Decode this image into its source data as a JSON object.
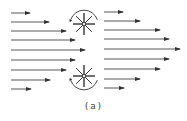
{
  "caption": "(a)",
  "colors": {
    "stroke": "#333333",
    "background": "#ffffff"
  },
  "diagram": {
    "left_arrows": [
      {
        "y": 13,
        "x1": 11,
        "x2": 30
      },
      {
        "y": 22,
        "x1": 11,
        "x2": 49
      },
      {
        "y": 31,
        "x1": 11,
        "x2": 66
      },
      {
        "y": 40,
        "x1": 11,
        "x2": 75
      },
      {
        "y": 50,
        "x1": 11,
        "x2": 85
      },
      {
        "y": 60,
        "x1": 11,
        "x2": 75
      },
      {
        "y": 70,
        "x1": 11,
        "x2": 66
      },
      {
        "y": 80,
        "x1": 11,
        "x2": 50
      },
      {
        "y": 89,
        "x1": 11,
        "x2": 31
      }
    ],
    "right_arrows": [
      {
        "y": 12,
        "x1": 104,
        "x2": 123
      },
      {
        "y": 21,
        "x1": 104,
        "x2": 140
      },
      {
        "y": 30,
        "x1": 104,
        "x2": 160
      },
      {
        "y": 39,
        "x1": 104,
        "x2": 169
      },
      {
        "y": 49,
        "x1": 104,
        "x2": 180
      },
      {
        "y": 59,
        "x1": 104,
        "x2": 169
      },
      {
        "y": 69,
        "x1": 104,
        "x2": 160
      },
      {
        "y": 79,
        "x1": 104,
        "x2": 140
      },
      {
        "y": 88,
        "x1": 104,
        "x2": 124
      }
    ],
    "vortices": [
      {
        "cx": 84,
        "cy": 24,
        "radius": 11,
        "rotation": "counterclockwise",
        "arc_position": "top"
      },
      {
        "cx": 84,
        "cy": 76,
        "radius": 11,
        "rotation": "clockwise",
        "arc_position": "bottom"
      }
    ]
  }
}
